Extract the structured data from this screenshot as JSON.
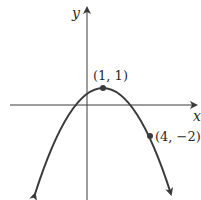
{
  "figure": {
    "axes": {
      "x_label": "x",
      "y_label": "y"
    },
    "points": [
      {
        "label": "(1, 1)",
        "x": 1,
        "y": 1,
        "role": "vertex"
      },
      {
        "label": "(4, −2)",
        "x": 4,
        "y": -2,
        "role": "point"
      }
    ],
    "curve": {
      "type": "parabola",
      "opens": "down",
      "equation": "y = -(x-1)^2/3 + 1"
    },
    "colors": {
      "curve": "#3a3a3a",
      "axes": "#3a3a3a",
      "point": "#3a3a3a"
    }
  }
}
